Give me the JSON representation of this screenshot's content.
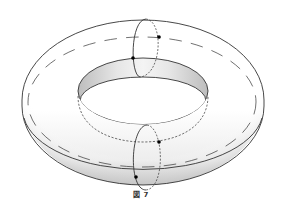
{
  "figure": {
    "caption": "図 7",
    "colors": {
      "stroke": "#333333",
      "shade_dark": "#b0b0b0",
      "shade_light": "#ffffff",
      "point": "#000000"
    }
  }
}
